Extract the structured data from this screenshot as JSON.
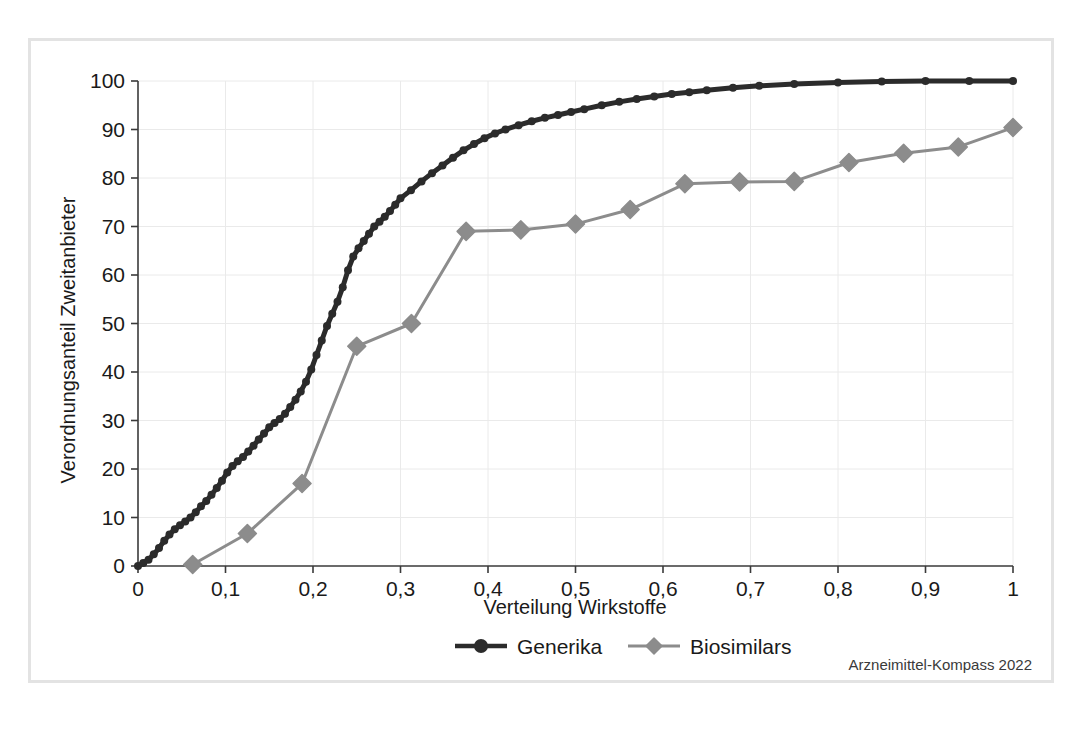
{
  "figure": {
    "border_color": "#e3e3e3",
    "background": "#ffffff"
  },
  "source_note": "Arzneimittel-Kompass 2022",
  "legend": {
    "position": "bottom",
    "entries": [
      {
        "label": "Generika",
        "color": "#2b2b2b",
        "marker": "circle"
      },
      {
        "label": "Biosimilars",
        "color": "#8c8c8c",
        "marker": "diamond"
      }
    ]
  },
  "chart_data": {
    "type": "line",
    "title": "",
    "subtitle": "",
    "xlabel": "Verteilung Wirkstoffe",
    "ylabel": "Verordnungsanteil Zweitanbieter",
    "xlim": [
      0,
      1
    ],
    "ylim": [
      0,
      100
    ],
    "grid": true,
    "xticks": [
      0,
      0.1,
      0.2,
      0.3,
      0.4,
      0.5,
      0.6,
      0.7,
      0.8,
      0.9,
      1
    ],
    "xticklabels": [
      "0",
      "0,1",
      "0,2",
      "0,3",
      "0,4",
      "0,5",
      "0,6",
      "0,7",
      "0,8",
      "0,9",
      "1"
    ],
    "yticks": [
      0,
      10,
      20,
      30,
      40,
      50,
      60,
      70,
      80,
      90,
      100
    ],
    "yticklabels": [
      "0",
      "10",
      "20",
      "30",
      "40",
      "50",
      "60",
      "70",
      "80",
      "90",
      "100"
    ],
    "series": [
      {
        "name": "Generika",
        "color": "#2b2b2b",
        "marker": "circle",
        "marker_size": 4,
        "line_width": 5,
        "x": [
          0.0,
          0.006,
          0.012,
          0.018,
          0.024,
          0.03,
          0.036,
          0.042,
          0.048,
          0.054,
          0.06,
          0.066,
          0.072,
          0.078,
          0.084,
          0.09,
          0.096,
          0.102,
          0.108,
          0.114,
          0.12,
          0.126,
          0.132,
          0.138,
          0.144,
          0.15,
          0.156,
          0.162,
          0.168,
          0.174,
          0.18,
          0.186,
          0.192,
          0.198,
          0.204,
          0.21,
          0.216,
          0.222,
          0.228,
          0.234,
          0.24,
          0.246,
          0.252,
          0.258,
          0.264,
          0.27,
          0.276,
          0.282,
          0.288,
          0.294,
          0.3,
          0.312,
          0.324,
          0.336,
          0.348,
          0.36,
          0.372,
          0.384,
          0.396,
          0.408,
          0.42,
          0.435,
          0.45,
          0.465,
          0.48,
          0.495,
          0.51,
          0.53,
          0.55,
          0.57,
          0.59,
          0.61,
          0.63,
          0.65,
          0.68,
          0.71,
          0.75,
          0.8,
          0.85,
          0.9,
          0.95,
          1.0
        ],
        "y": [
          0.0,
          0.6,
          1.3,
          2.4,
          3.7,
          5.2,
          6.5,
          7.6,
          8.4,
          9.2,
          10.0,
          11.1,
          12.3,
          13.4,
          14.7,
          16.1,
          17.6,
          19.3,
          20.6,
          21.6,
          22.5,
          23.6,
          24.8,
          26.1,
          27.3,
          28.6,
          29.5,
          30.3,
          31.4,
          32.8,
          34.3,
          36.0,
          38.0,
          40.5,
          43.5,
          46.5,
          49.5,
          52.0,
          54.5,
          57.5,
          61.0,
          63.8,
          65.5,
          67.0,
          68.5,
          70.0,
          71.0,
          72.0,
          73.2,
          74.5,
          75.8,
          77.5,
          79.3,
          81.0,
          82.6,
          84.2,
          85.7,
          87.0,
          88.2,
          89.2,
          90.0,
          90.9,
          91.7,
          92.4,
          93.0,
          93.6,
          94.2,
          95.0,
          95.7,
          96.3,
          96.8,
          97.3,
          97.7,
          98.1,
          98.6,
          99.0,
          99.4,
          99.7,
          99.9,
          100.0,
          100.0,
          100.0
        ]
      },
      {
        "name": "Biosimilars",
        "color": "#8c8c8c",
        "marker": "diamond",
        "marker_size": 9,
        "line_width": 3,
        "x": [
          0.0625,
          0.125,
          0.1875,
          0.25,
          0.3125,
          0.375,
          0.4375,
          0.5,
          0.5625,
          0.625,
          0.6875,
          0.75,
          0.8125,
          0.875,
          0.9375,
          1.0
        ],
        "y": [
          0.3,
          6.7,
          17.0,
          45.3,
          50.0,
          69.0,
          69.3,
          70.5,
          73.5,
          78.8,
          79.2,
          79.3,
          83.2,
          85.1,
          86.4,
          90.4
        ]
      }
    ]
  }
}
